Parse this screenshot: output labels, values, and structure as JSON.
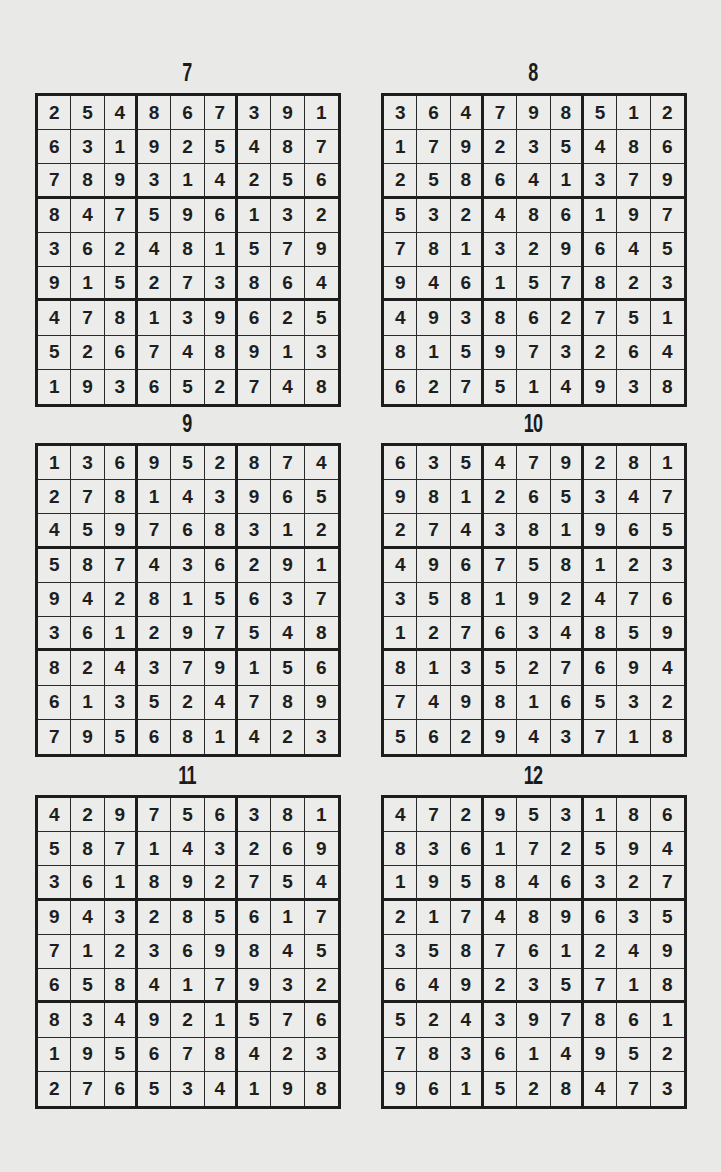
{
  "page": {
    "puzzles": [
      {
        "label": "7",
        "grid": [
          [
            2,
            5,
            4,
            8,
            6,
            7,
            3,
            9,
            1
          ],
          [
            6,
            3,
            1,
            9,
            2,
            5,
            4,
            8,
            7
          ],
          [
            7,
            8,
            9,
            3,
            1,
            4,
            2,
            5,
            6
          ],
          [
            8,
            4,
            7,
            5,
            9,
            6,
            1,
            3,
            2
          ],
          [
            3,
            6,
            2,
            4,
            8,
            1,
            5,
            7,
            9
          ],
          [
            9,
            1,
            5,
            2,
            7,
            3,
            8,
            6,
            4
          ],
          [
            4,
            7,
            8,
            1,
            3,
            9,
            6,
            2,
            5
          ],
          [
            5,
            2,
            6,
            7,
            4,
            8,
            9,
            1,
            3
          ],
          [
            1,
            9,
            3,
            6,
            5,
            2,
            7,
            4,
            8
          ]
        ]
      },
      {
        "label": "8",
        "grid": [
          [
            3,
            6,
            4,
            7,
            9,
            8,
            5,
            1,
            2
          ],
          [
            1,
            7,
            9,
            2,
            3,
            5,
            4,
            8,
            6
          ],
          [
            2,
            5,
            8,
            6,
            4,
            1,
            3,
            7,
            9
          ],
          [
            5,
            3,
            2,
            4,
            8,
            6,
            1,
            9,
            7
          ],
          [
            7,
            8,
            1,
            3,
            2,
            9,
            6,
            4,
            5
          ],
          [
            9,
            4,
            6,
            1,
            5,
            7,
            8,
            2,
            3
          ],
          [
            4,
            9,
            3,
            8,
            6,
            2,
            7,
            5,
            1
          ],
          [
            8,
            1,
            5,
            9,
            7,
            3,
            2,
            6,
            4
          ],
          [
            6,
            2,
            7,
            5,
            1,
            4,
            9,
            3,
            8
          ]
        ]
      },
      {
        "label": "9",
        "grid": [
          [
            1,
            3,
            6,
            9,
            5,
            2,
            8,
            7,
            4
          ],
          [
            2,
            7,
            8,
            1,
            4,
            3,
            9,
            6,
            5
          ],
          [
            4,
            5,
            9,
            7,
            6,
            8,
            3,
            1,
            2
          ],
          [
            5,
            8,
            7,
            4,
            3,
            6,
            2,
            9,
            1
          ],
          [
            9,
            4,
            2,
            8,
            1,
            5,
            6,
            3,
            7
          ],
          [
            3,
            6,
            1,
            2,
            9,
            7,
            5,
            4,
            8
          ],
          [
            8,
            2,
            4,
            3,
            7,
            9,
            1,
            5,
            6
          ],
          [
            6,
            1,
            3,
            5,
            2,
            4,
            7,
            8,
            9
          ],
          [
            7,
            9,
            5,
            6,
            8,
            1,
            4,
            2,
            3
          ]
        ]
      },
      {
        "label": "10",
        "grid": [
          [
            6,
            3,
            5,
            4,
            7,
            9,
            2,
            8,
            1
          ],
          [
            9,
            8,
            1,
            2,
            6,
            5,
            3,
            4,
            7
          ],
          [
            2,
            7,
            4,
            3,
            8,
            1,
            9,
            6,
            5
          ],
          [
            4,
            9,
            6,
            7,
            5,
            8,
            1,
            2,
            3
          ],
          [
            3,
            5,
            8,
            1,
            9,
            2,
            4,
            7,
            6
          ],
          [
            1,
            2,
            7,
            6,
            3,
            4,
            8,
            5,
            9
          ],
          [
            8,
            1,
            3,
            5,
            2,
            7,
            6,
            9,
            4
          ],
          [
            7,
            4,
            9,
            8,
            1,
            6,
            5,
            3,
            2
          ],
          [
            5,
            6,
            2,
            9,
            4,
            3,
            7,
            1,
            8
          ]
        ]
      },
      {
        "label": "11",
        "grid": [
          [
            4,
            2,
            9,
            7,
            5,
            6,
            3,
            8,
            1
          ],
          [
            5,
            8,
            7,
            1,
            4,
            3,
            2,
            6,
            9
          ],
          [
            3,
            6,
            1,
            8,
            9,
            2,
            7,
            5,
            4
          ],
          [
            9,
            4,
            3,
            2,
            8,
            5,
            6,
            1,
            7
          ],
          [
            7,
            1,
            2,
            3,
            6,
            9,
            8,
            4,
            5
          ],
          [
            6,
            5,
            8,
            4,
            1,
            7,
            9,
            3,
            2
          ],
          [
            8,
            3,
            4,
            9,
            2,
            1,
            5,
            7,
            6
          ],
          [
            1,
            9,
            5,
            6,
            7,
            8,
            4,
            2,
            3
          ],
          [
            2,
            7,
            6,
            5,
            3,
            4,
            1,
            9,
            8
          ]
        ]
      },
      {
        "label": "12",
        "grid": [
          [
            4,
            7,
            2,
            9,
            5,
            3,
            1,
            8,
            6
          ],
          [
            8,
            3,
            6,
            1,
            7,
            2,
            5,
            9,
            4
          ],
          [
            1,
            9,
            5,
            8,
            4,
            6,
            3,
            2,
            7
          ],
          [
            2,
            1,
            7,
            4,
            8,
            9,
            6,
            3,
            5
          ],
          [
            3,
            5,
            8,
            7,
            6,
            1,
            2,
            4,
            9
          ],
          [
            6,
            4,
            9,
            2,
            3,
            5,
            7,
            1,
            8
          ],
          [
            5,
            2,
            4,
            3,
            9,
            7,
            8,
            6,
            1
          ],
          [
            7,
            8,
            3,
            6,
            1,
            4,
            9,
            5,
            2
          ],
          [
            9,
            6,
            1,
            5,
            2,
            8,
            4,
            7,
            3
          ]
        ]
      }
    ]
  }
}
